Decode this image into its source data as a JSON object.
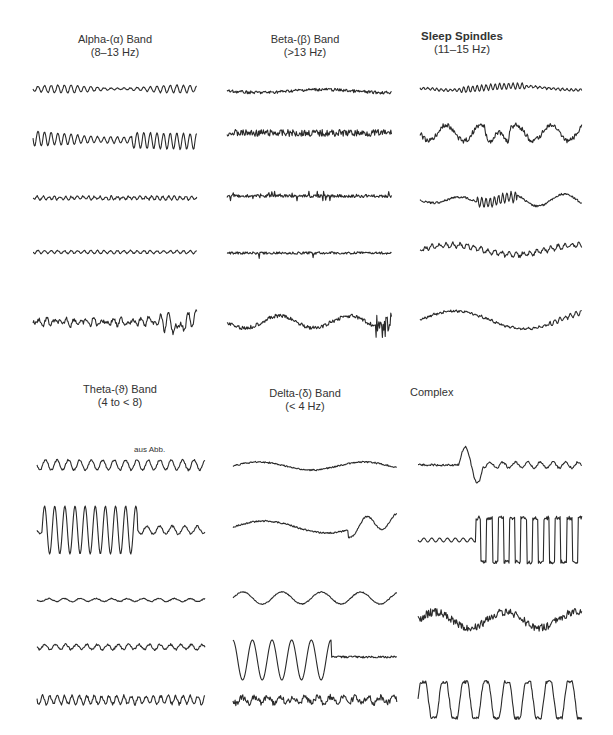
{
  "panels": [
    {
      "title": "Alpha-(α) Band",
      "subtitle": "(8–13 Hz)"
    },
    {
      "title": "Beta-(β) Band",
      "subtitle": "(>13 Hz)"
    },
    {
      "title": "Sleep Spindles",
      "subtitle": "(11–15 Hz)"
    },
    {
      "title": "Theta-(ϑ) Band",
      "subtitle": "(4 to < 8)"
    },
    {
      "title": "Delta-(δ) Band",
      "subtitle": "(< 4 Hz)"
    },
    {
      "title": "Complex",
      "subtitle": ""
    }
  ],
  "annotation": "aus Abb."
}
